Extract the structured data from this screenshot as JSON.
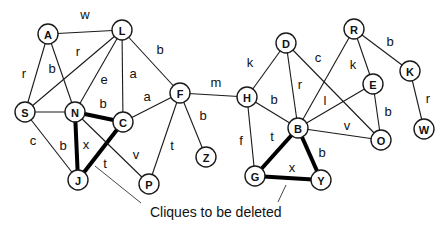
{
  "title": "",
  "annotation": {
    "text": "Cliques to be deleted",
    "x": 150,
    "y": 217
  },
  "pointers": [
    {
      "x1": 95,
      "y1": 166,
      "x2": 141,
      "y2": 203
    },
    {
      "x1": 286,
      "y1": 185,
      "x2": 278,
      "y2": 202
    }
  ],
  "nodes": [
    {
      "id": "A",
      "x": 48,
      "y": 34
    },
    {
      "id": "L",
      "x": 122,
      "y": 30
    },
    {
      "id": "S",
      "x": 25,
      "y": 112
    },
    {
      "id": "N",
      "x": 75,
      "y": 112
    },
    {
      "id": "C",
      "x": 123,
      "y": 122
    },
    {
      "id": "F",
      "x": 180,
      "y": 93
    },
    {
      "id": "J",
      "x": 78,
      "y": 180
    },
    {
      "id": "P",
      "x": 149,
      "y": 184
    },
    {
      "id": "Z",
      "x": 206,
      "y": 157
    },
    {
      "id": "H",
      "x": 247,
      "y": 97
    },
    {
      "id": "D",
      "x": 286,
      "y": 43
    },
    {
      "id": "B",
      "x": 298,
      "y": 128
    },
    {
      "id": "G",
      "x": 255,
      "y": 176
    },
    {
      "id": "Y",
      "x": 321,
      "y": 180
    },
    {
      "id": "R",
      "x": 354,
      "y": 29
    },
    {
      "id": "E",
      "x": 373,
      "y": 84
    },
    {
      "id": "K",
      "x": 410,
      "y": 71
    },
    {
      "id": "O",
      "x": 381,
      "y": 140
    },
    {
      "id": "W",
      "x": 424,
      "y": 129
    }
  ],
  "edges": [
    {
      "from": "A",
      "to": "L",
      "label": "w",
      "lx": 85,
      "ly": 14,
      "clique": false
    },
    {
      "from": "A",
      "to": "S",
      "label": "r",
      "lx": 24,
      "ly": 73,
      "clique": false
    },
    {
      "from": "A",
      "to": "N",
      "label": "b",
      "lx": 52,
      "ly": 68,
      "clique": false
    },
    {
      "from": "L",
      "to": "S",
      "label": "r",
      "lx": 78,
      "ly": 51,
      "clique": false
    },
    {
      "from": "L",
      "to": "N",
      "label": "e",
      "lx": 104,
      "ly": 79,
      "clique": false
    },
    {
      "from": "L",
      "to": "C",
      "label": "a",
      "lx": 133,
      "ly": 73,
      "clique": false
    },
    {
      "from": "L",
      "to": "F",
      "label": "b",
      "lx": 160,
      "ly": 49,
      "clique": false
    },
    {
      "from": "S",
      "to": "N",
      "label": "",
      "lx": 0,
      "ly": 0,
      "clique": false
    },
    {
      "from": "S",
      "to": "J",
      "label": "c",
      "lx": 33,
      "ly": 140,
      "clique": false
    },
    {
      "from": "N",
      "to": "C",
      "label": "b",
      "lx": 103,
      "ly": 103,
      "clique": true
    },
    {
      "from": "N",
      "to": "J",
      "label": "b",
      "lx": 63,
      "ly": 145,
      "clique": true
    },
    {
      "from": "C",
      "to": "J",
      "label": "t",
      "lx": 105,
      "ly": 163,
      "clique": true
    },
    {
      "from": "N",
      "to": "P",
      "label": "v",
      "lx": 136,
      "ly": 154,
      "clique": false
    },
    {
      "from": "C",
      "to": "F",
      "label": "a",
      "lx": 147,
      "ly": 96,
      "clique": false
    },
    {
      "from": "F",
      "to": "P",
      "label": "t",
      "lx": 172,
      "ly": 145,
      "clique": false
    },
    {
      "from": "F",
      "to": "Z",
      "label": "b",
      "lx": 203,
      "ly": 115,
      "clique": false
    },
    {
      "from": "F",
      "to": "H",
      "label": "m",
      "lx": 216,
      "ly": 82,
      "clique": false
    },
    {
      "from": "H",
      "to": "D",
      "label": "k",
      "lx": 250,
      "ly": 62,
      "clique": false
    },
    {
      "from": "H",
      "to": "B",
      "label": "b",
      "lx": 274,
      "ly": 99,
      "clique": false
    },
    {
      "from": "H",
      "to": "G",
      "label": "f",
      "lx": 241,
      "ly": 140,
      "clique": false
    },
    {
      "from": "D",
      "to": "B",
      "label": "r",
      "lx": 300,
      "ly": 84,
      "clique": false
    },
    {
      "from": "D",
      "to": "O",
      "label": "c",
      "lx": 318,
      "ly": 57,
      "clique": false
    },
    {
      "from": "R",
      "to": "B",
      "label": "",
      "lx": 0,
      "ly": 0,
      "clique": false
    },
    {
      "from": "R",
      "to": "E",
      "label": "k",
      "lx": 353,
      "ly": 64,
      "clique": false
    },
    {
      "from": "R",
      "to": "K",
      "label": "b",
      "lx": 390,
      "ly": 41,
      "clique": false
    },
    {
      "from": "E",
      "to": "B",
      "label": "l",
      "lx": 325,
      "ly": 100,
      "clique": false
    },
    {
      "from": "E",
      "to": "O",
      "label": "b",
      "lx": 388,
      "ly": 111,
      "clique": false
    },
    {
      "from": "B",
      "to": "O",
      "label": "v",
      "lx": 347,
      "ly": 125,
      "clique": false
    },
    {
      "from": "K",
      "to": "W",
      "label": "r",
      "lx": 428,
      "ly": 98,
      "clique": false
    },
    {
      "from": "B",
      "to": "G",
      "label": "t",
      "lx": 272,
      "ly": 136,
      "clique": true
    },
    {
      "from": "B",
      "to": "Y",
      "label": "b",
      "lx": 322,
      "ly": 152,
      "clique": true
    },
    {
      "from": "G",
      "to": "Y",
      "label": "x",
      "lx": 292,
      "ly": 167,
      "clique": true
    },
    {
      "from": "N",
      "to": "J",
      "label": "x",
      "lx": 86,
      "ly": 144,
      "clique": false,
      "label_only": true
    }
  ]
}
